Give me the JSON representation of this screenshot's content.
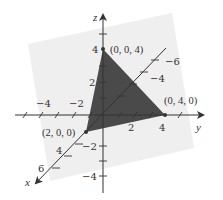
{
  "diagram": {
    "type": "3d-coordinate-plot",
    "colors": {
      "background": "#ffffff",
      "plane": "#efefef",
      "triangle": "#4a4a4a",
      "axes": "#333333",
      "text": "#333333"
    },
    "axes": {
      "x": {
        "label": "x",
        "ticks": [
          "2",
          "4",
          "6"
        ]
      },
      "y": {
        "label": "y",
        "ticks": [
          "−4",
          "−2",
          "2",
          "4"
        ]
      },
      "z": {
        "label": "z",
        "ticks": [
          "4",
          "2",
          "−2",
          "−4"
        ]
      },
      "x_negative_ticks": [
        "−4",
        "−6"
      ]
    },
    "points": [
      {
        "label": "(0, 0, 4)"
      },
      {
        "label": "(0, 4, 0)"
      },
      {
        "label": "(2, 0, 0)"
      }
    ]
  }
}
